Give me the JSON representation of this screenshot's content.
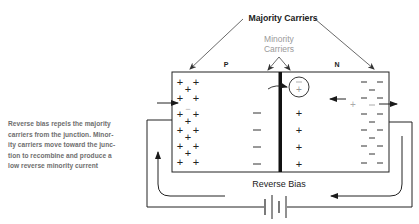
{
  "diagram": {
    "labels": {
      "majority_carriers": "Majority Carriers",
      "minority_carriers_line1": "Minority",
      "minority_carriers_line2": "Carriers",
      "p_region": "P",
      "n_region": "N",
      "reverse_bias": "Reverse Bias"
    },
    "caption": "Reverse bias repels the majority carriers from the junction. Minority carriers move toward the junction to recombine and produce a low reverse minority current",
    "caption_lines": [
      "Reverse bias repels the majority",
      "carriers from the junction.  Minor-",
      "ity carriers move toward the junc-",
      "tion to recombine and produce a",
      "low reverse minority current"
    ],
    "symbols": {
      "hole": "+",
      "electron": "−",
      "minority_in_circle_top": "−",
      "minority_in_circle_bottom": "+"
    },
    "colors": {
      "line": "#1a1a1a",
      "caption": "#6e6e6e",
      "minority_label": "#9a9a9a",
      "minority_carrier": "#aaaaaa"
    }
  }
}
